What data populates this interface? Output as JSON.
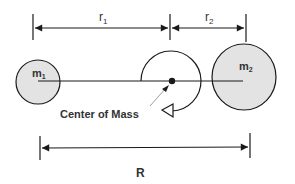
{
  "diagram": {
    "labels": {
      "r1": "r",
      "r1_sub": "1",
      "r2": "r",
      "r2_sub": "2",
      "m1": "m",
      "m1_sub": "1",
      "m2": "m",
      "m2_sub": "2",
      "center_of_mass": "Center of Mass",
      "R": "R"
    },
    "colors": {
      "mass_fill": "#e3e3e3",
      "stroke": "#1a1a1a",
      "text": "#333333",
      "background": "#ffffff"
    }
  }
}
